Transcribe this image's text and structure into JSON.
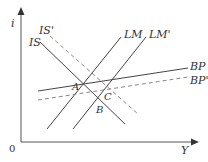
{
  "diagram": {
    "axes": {
      "y_label": "i",
      "x_label": "Y",
      "origin_label": "0"
    },
    "curves": [
      {
        "id": "IS",
        "label": "IS",
        "style": "solid",
        "x1": 40,
        "y1": 42,
        "x2": 125,
        "y2": 124,
        "label_x": 29,
        "label_y": 46
      },
      {
        "id": "IS_prime",
        "label": "IS'",
        "style": "dashed",
        "x1": 50,
        "y1": 36,
        "x2": 138,
        "y2": 114,
        "label_x": 39,
        "label_y": 34
      },
      {
        "id": "LM",
        "label": "LM",
        "style": "solid",
        "x1": 47,
        "y1": 129,
        "x2": 121,
        "y2": 37,
        "label_x": 124,
        "label_y": 38
      },
      {
        "id": "LM_prime",
        "label": "LM'",
        "style": "solid",
        "x1": 73,
        "y1": 129,
        "x2": 146,
        "y2": 37,
        "label_x": 149,
        "label_y": 38
      },
      {
        "id": "BP",
        "label": "BP",
        "style": "solid",
        "x1": 38,
        "y1": 91,
        "x2": 188,
        "y2": 68,
        "label_x": 190,
        "label_y": 70
      },
      {
        "id": "BP_prime",
        "label": "BP'",
        "style": "dashed",
        "x1": 38,
        "y1": 100,
        "x2": 188,
        "y2": 77,
        "label_x": 190,
        "label_y": 84
      }
    ],
    "points": [
      {
        "label": "A",
        "x": 72,
        "y": 90
      },
      {
        "label": "B",
        "x": 96,
        "y": 113
      },
      {
        "label": "C",
        "x": 104,
        "y": 100
      }
    ],
    "colors": {
      "line": "#444444",
      "dashed": "#888888",
      "axis": "#555555"
    }
  }
}
